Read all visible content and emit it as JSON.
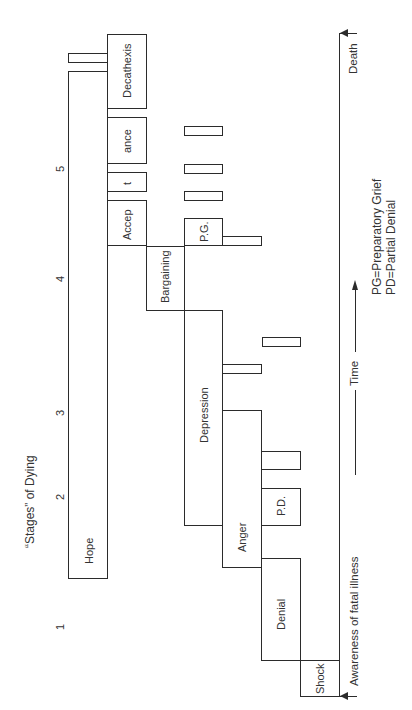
{
  "title": "“Stages” of Dying",
  "stage_numbers": [
    {
      "label": "1",
      "x": 55,
      "y": 630
    },
    {
      "label": "2",
      "x": 55,
      "y": 500
    },
    {
      "label": "3",
      "x": 55,
      "y": 416
    },
    {
      "label": "4",
      "x": 55,
      "y": 282
    },
    {
      "label": "5",
      "x": 55,
      "y": 172
    }
  ],
  "boxes": [
    {
      "name": "hope",
      "label": "Hope",
      "x": 68,
      "y": 71,
      "w": 40,
      "h": 508,
      "lx": 84,
      "ly": 564
    },
    {
      "name": "hope-top-bar",
      "label": "",
      "x": 68,
      "y": 53,
      "w": 40,
      "h": 10
    },
    {
      "name": "decathexis",
      "label": "Decathexis",
      "x": 107,
      "y": 34,
      "w": 40,
      "h": 75,
      "lx": 122,
      "ly": 98
    },
    {
      "name": "acceptance-ance",
      "label": "ance",
      "x": 107,
      "y": 117,
      "w": 40,
      "h": 47,
      "lx": 122,
      "ly": 153
    },
    {
      "name": "acceptance-t",
      "label": "t",
      "x": 107,
      "y": 172,
      "w": 40,
      "h": 20,
      "lx": 122,
      "ly": 185
    },
    {
      "name": "acceptance-accep",
      "label": "Accep",
      "x": 107,
      "y": 200,
      "w": 40,
      "h": 46,
      "lx": 122,
      "ly": 240
    },
    {
      "name": "bargaining",
      "label": "Bargaining",
      "x": 146,
      "y": 246,
      "w": 39,
      "h": 65,
      "lx": 160,
      "ly": 303
    },
    {
      "name": "preparatory-grief",
      "label": "P.G.",
      "x": 184,
      "y": 218,
      "w": 39,
      "h": 28,
      "lx": 199,
      "ly": 242
    },
    {
      "name": "pg-bar-1",
      "label": "",
      "x": 184,
      "y": 126,
      "w": 39,
      "h": 10
    },
    {
      "name": "pg-bar-2",
      "label": "",
      "x": 184,
      "y": 164,
      "w": 39,
      "h": 10
    },
    {
      "name": "pg-bar-3",
      "label": "",
      "x": 184,
      "y": 191,
      "w": 39,
      "h": 10
    },
    {
      "name": "pg-side-bar",
      "label": "",
      "x": 222,
      "y": 236,
      "w": 40,
      "h": 10
    },
    {
      "name": "depression-bar-1",
      "label": "",
      "x": 222,
      "y": 364,
      "w": 40,
      "h": 10
    },
    {
      "name": "depression-bar-2",
      "label": "",
      "x": 262,
      "y": 337,
      "w": 39,
      "h": 10
    },
    {
      "name": "anger",
      "label": "Anger",
      "x": 222,
      "y": 410,
      "w": 40,
      "h": 158,
      "lx": 237,
      "ly": 552
    },
    {
      "name": "anger-bar",
      "label": "",
      "x": 261,
      "y": 451,
      "w": 40,
      "h": 19
    },
    {
      "name": "partial-denial",
      "label": "P.D.",
      "x": 261,
      "y": 488,
      "w": 40,
      "h": 38,
      "lx": 276,
      "ly": 516
    },
    {
      "name": "denial",
      "label": "Denial",
      "x": 261,
      "y": 558,
      "w": 40,
      "h": 103,
      "lx": 276,
      "ly": 630
    },
    {
      "name": "shock",
      "label": "Shock",
      "x": 300,
      "y": 660,
      "w": 40,
      "h": 37,
      "lx": 315,
      "ly": 694
    }
  ],
  "depression": {
    "label": "Depression",
    "x": 184,
    "y": 310,
    "w": 39,
    "h": 216,
    "lx": 199,
    "ly": 443
  },
  "timeline": {
    "death_label": "Death",
    "awareness_label": "Awareness of fatal illness",
    "time_label": "Time",
    "x": 339,
    "top": 33,
    "bottom": 696
  },
  "legend": [
    "PG=Preparatory Grief",
    "PD=Partial Denial"
  ]
}
